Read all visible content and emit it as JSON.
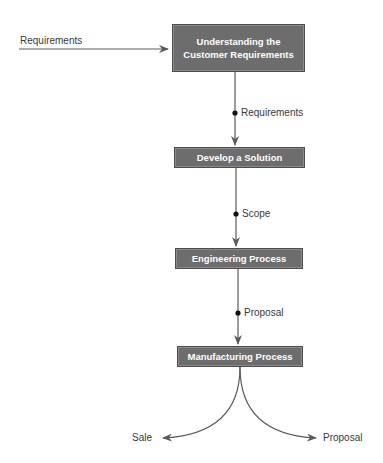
{
  "diagram": {
    "type": "process-flow",
    "colors": {
      "box_fill": "#6d6d6d",
      "box_text": "#ffffff",
      "line": "#5a5a5a",
      "label_text": "#3a3a3a"
    },
    "input": {
      "label": "Requirements"
    },
    "nodes": [
      {
        "id": "understand",
        "label": "Understanding the Customer Requirements"
      },
      {
        "id": "develop",
        "label": "Develop a Solution"
      },
      {
        "id": "engineering",
        "label": "Engineering Process"
      },
      {
        "id": "manufacturing",
        "label": "Manufacturing Process"
      }
    ],
    "edges": [
      {
        "from": "input",
        "to": "understand",
        "label": "Requirements"
      },
      {
        "from": "understand",
        "to": "develop",
        "label": "Requirements"
      },
      {
        "from": "develop",
        "to": "engineering",
        "label": "Scope"
      },
      {
        "from": "engineering",
        "to": "manufacturing",
        "label": "Proposal"
      },
      {
        "from": "manufacturing",
        "to": "sale",
        "label": "Sale"
      },
      {
        "from": "manufacturing",
        "to": "proposal-out",
        "label": "Proposal"
      }
    ],
    "outputs": {
      "left": "Sale",
      "right": "Proposal"
    }
  }
}
